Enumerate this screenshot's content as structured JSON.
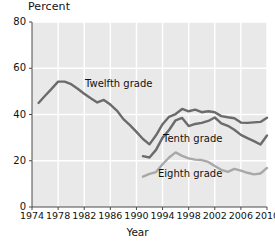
{
  "chart_data": {
    "type": "line",
    "title": "",
    "xlabel": "Year",
    "ylabel": "Percent",
    "xlim": [
      1974,
      2010
    ],
    "ylim": [
      0,
      80
    ],
    "grid": true,
    "legend_position": "inline-labels",
    "yticks": [
      0,
      20,
      40,
      60,
      80
    ],
    "xticks": [
      1974,
      1978,
      1982,
      1986,
      1990,
      1994,
      1998,
      2002,
      2006,
      2010
    ],
    "colors": {
      "twelfth": "#6b6b6b",
      "tenth": "#6b6b6b",
      "eighth": "#a8a8a8",
      "plot_background": "#e9e9e9",
      "gridline": "#ffffff",
      "axis": "#4a4a4a",
      "text": "#111111"
    },
    "series": [
      {
        "name": "Twelfth grade",
        "color": "#6b6b6b",
        "x": [
          1975,
          1976,
          1977,
          1978,
          1979,
          1980,
          1981,
          1982,
          1983,
          1984,
          1985,
          1986,
          1987,
          1988,
          1989,
          1990,
          1991,
          1992,
          1993,
          1994,
          1995,
          1996,
          1997,
          1998,
          1999,
          2000,
          2001,
          2002,
          2003,
          2004,
          2005,
          2006,
          2007,
          2008,
          2009,
          2010
        ],
        "values": [
          45.0,
          48.1,
          51.1,
          54.2,
          54.2,
          53.1,
          51.1,
          49.0,
          47.0,
          45.2,
          46.3,
          44.3,
          41.7,
          38.0,
          35.4,
          32.5,
          29.4,
          27.1,
          31.0,
          35.8,
          39.0,
          40.2,
          42.4,
          41.4,
          42.1,
          41.0,
          41.4,
          41.0,
          39.3,
          38.8,
          38.4,
          36.5,
          36.4,
          36.6,
          36.8,
          38.6
        ]
      },
      {
        "name": "Tenth grade",
        "color": "#6b6b6b",
        "x": [
          1991,
          1992,
          1993,
          1994,
          1995,
          1996,
          1997,
          1998,
          1999,
          2000,
          2001,
          2002,
          2003,
          2004,
          2005,
          2006,
          2007,
          2008,
          2009,
          2010
        ],
        "values": [
          22.0,
          21.4,
          24.7,
          30.0,
          33.3,
          37.5,
          38.5,
          35.0,
          35.9,
          36.4,
          37.2,
          38.7,
          36.2,
          35.1,
          33.4,
          31.2,
          29.8,
          28.5,
          27.0,
          30.9
        ]
      },
      {
        "name": "Eighth grade",
        "color": "#a8a8a8",
        "x": [
          1991,
          1992,
          1993,
          1994,
          1995,
          1996,
          1997,
          1998,
          1999,
          2000,
          2001,
          2002,
          2003,
          2004,
          2005,
          2006,
          2007,
          2008,
          2009,
          2010
        ],
        "values": [
          13.1,
          14.3,
          15.1,
          18.5,
          21.4,
          23.6,
          22.1,
          21.0,
          20.5,
          20.3,
          19.5,
          17.7,
          16.1,
          15.2,
          16.5,
          15.7,
          14.8,
          14.1,
          14.5,
          16.9
        ]
      }
    ],
    "annotations": [
      {
        "text": "Twelfth grade",
        "series": "Twelfth grade"
      },
      {
        "text": "Tenth grade",
        "series": "Tenth grade"
      },
      {
        "text": "Eighth grade",
        "series": "Eighth grade"
      }
    ]
  },
  "labels": {
    "y_axis_title": "Percent",
    "x_axis_title": "Year",
    "twelfth": "Twelfth grade",
    "tenth": "Tenth grade",
    "eighth": "Eighth grade",
    "yticks": [
      "80",
      "60",
      "40",
      "20",
      "0"
    ],
    "xticks": [
      "1974",
      "1978",
      "1982",
      "1986",
      "1990",
      "1994",
      "1998",
      "2002",
      "2006",
      "2010"
    ]
  }
}
